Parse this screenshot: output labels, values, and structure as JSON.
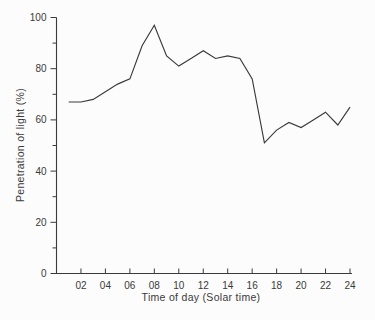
{
  "figure": {
    "background": "#fcfcfc",
    "ink_color": "#3a3a3a"
  },
  "chart_data": {
    "type": "line",
    "title": "",
    "xlabel": "Time of day (Solar time)",
    "ylabel": "Penetration of light (%)",
    "x": [
      1,
      2,
      3,
      4,
      5,
      6,
      7,
      8,
      9,
      10,
      11,
      12,
      13,
      14,
      15,
      16,
      17,
      18,
      19,
      20,
      21,
      22,
      23,
      24
    ],
    "series": [
      {
        "name": "penetration-of-light",
        "values": [
          67,
          67,
          68,
          71,
          74,
          76,
          89,
          97,
          85,
          81,
          84,
          87,
          84,
          85,
          84,
          76,
          51,
          56,
          59,
          57,
          60,
          63,
          58,
          65
        ]
      }
    ],
    "xlim": [
      0,
      24
    ],
    "ylim": [
      0,
      100
    ],
    "x_tick_values": [
      2,
      4,
      6,
      8,
      10,
      12,
      14,
      16,
      18,
      20,
      22,
      24
    ],
    "x_tick_labels": [
      "02",
      "04",
      "06",
      "08",
      "10",
      "12",
      "14",
      "16",
      "18",
      "20",
      "22",
      "24"
    ],
    "y_major_tick_values": [
      0,
      20,
      40,
      60,
      80,
      100
    ],
    "y_major_tick_labels": [
      "0",
      "20",
      "40",
      "60",
      "80",
      "100"
    ],
    "y_minor_tick_values": [
      10,
      30,
      50,
      70,
      90
    ],
    "grid": false,
    "legend": "none",
    "line_color": "#3a3a3a"
  }
}
